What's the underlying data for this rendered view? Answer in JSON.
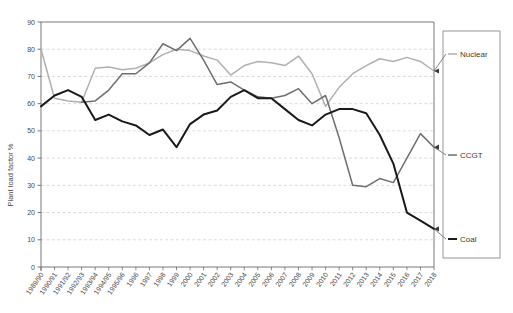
{
  "chart_data": {
    "type": "line",
    "title": "",
    "xlabel": "",
    "ylabel": "Plant load factor %",
    "ylim": [
      0,
      90
    ],
    "yticks": [
      0,
      10,
      20,
      30,
      40,
      50,
      60,
      70,
      80,
      90
    ],
    "grid": true,
    "legend_position": "right",
    "categories": [
      "1989/90",
      "1990/91",
      "1991/92",
      "1992/93",
      "1993/94",
      "1994/95",
      "1995/96",
      "1996",
      "1997",
      "1998",
      "1999",
      "2000",
      "2001",
      "2002",
      "2003",
      "2004",
      "2005",
      "2006",
      "2007",
      "2008",
      "2009",
      "2010",
      "2011",
      "2012",
      "2013",
      "2014",
      "2015",
      "2016",
      "2017",
      "2018"
    ],
    "series": [
      {
        "name": "Nuclear",
        "color": "#b0b0b0",
        "values": [
          80,
          62,
          61,
          60.5,
          73,
          73.5,
          72.5,
          73,
          75,
          78,
          80,
          79.5,
          77.5,
          76,
          70.5,
          74,
          75.5,
          75,
          74,
          77.5,
          71,
          59,
          66,
          71,
          74,
          76.5,
          75.5,
          77,
          75.5,
          72
        ]
      },
      {
        "name": "CCGT",
        "color": "#6e6e6e",
        "values": [
          null,
          null,
          null,
          60.5,
          61,
          65,
          71,
          71,
          75,
          82,
          79.5,
          84,
          76,
          67,
          68,
          65,
          62.5,
          62,
          63,
          65.5,
          60,
          63,
          47.5,
          30,
          29.5,
          32.5,
          31,
          40,
          49,
          44
        ]
      },
      {
        "name": "Coal",
        "color": "#1a1a1a",
        "values": [
          59,
          63,
          65,
          62.5,
          54,
          56,
          53.5,
          52,
          48.5,
          50.5,
          44,
          52.5,
          56,
          57.5,
          62.5,
          65,
          62,
          62,
          58,
          54,
          52,
          56,
          58,
          58,
          56.5,
          48.5,
          38,
          20,
          17,
          14
        ]
      }
    ],
    "annotations": [
      {
        "label": "Nuclear",
        "series": "Nuclear"
      },
      {
        "label": "CCGT",
        "series": "CCGT"
      },
      {
        "label": "Coal",
        "series": "Coal"
      }
    ]
  },
  "legend": {
    "items": [
      {
        "label": "Nuclear",
        "color": "#b0b0b0"
      },
      {
        "label": "CCGT",
        "color": "#6e6e6e"
      },
      {
        "label": "Coal",
        "color": "#1a1a1a"
      }
    ]
  }
}
